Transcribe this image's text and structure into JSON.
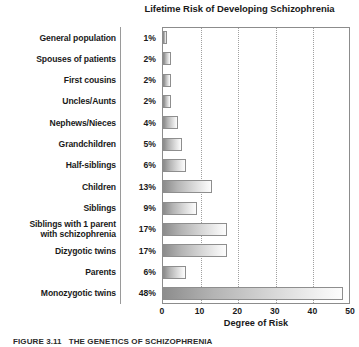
{
  "chart_data": {
    "type": "bar",
    "orientation": "horizontal",
    "title": "Lifetime Risk of Developing Schizophrenia",
    "xlabel": "Degree of Risk",
    "ylabel": "",
    "xlim": [
      0,
      50
    ],
    "xticks": [
      0,
      10,
      20,
      30,
      40,
      50
    ],
    "xtick_labels": [
      "0",
      "10",
      "20",
      "30",
      "40",
      "50"
    ],
    "grid": "vertical-dotted",
    "legend": "none",
    "categories": [
      "General population",
      "Spouses of patients",
      "First cousins",
      "Uncles/Aunts",
      "Nephews/Nieces",
      "Grandchildren",
      "Half-siblings",
      "Children",
      "Siblings",
      "Siblings with 1 parent with schizophrenia",
      "Dizygotic twins",
      "Parents",
      "Monozygotic twins"
    ],
    "values": [
      1,
      2,
      2,
      2,
      4,
      5,
      6,
      13,
      9,
      17,
      17,
      6,
      48
    ],
    "value_labels": [
      "1%",
      "2%",
      "2%",
      "2%",
      "4%",
      "5%",
      "6%",
      "13%",
      "9%",
      "17%",
      "17%",
      "6%",
      "48%"
    ],
    "unit": "%"
  },
  "rows": [
    {
      "label": "General population",
      "label_line1": "General population",
      "label_line2": "",
      "pct": "1%",
      "value": 1
    },
    {
      "label": "Spouses of patients",
      "label_line1": "Spouses of patients",
      "label_line2": "",
      "pct": "2%",
      "value": 2
    },
    {
      "label": "First cousins",
      "label_line1": "First cousins",
      "label_line2": "",
      "pct": "2%",
      "value": 2
    },
    {
      "label": "Uncles/Aunts",
      "label_line1": "Uncles/Aunts",
      "label_line2": "",
      "pct": "2%",
      "value": 2
    },
    {
      "label": "Nephews/Nieces",
      "label_line1": "Nephews/Nieces",
      "label_line2": "",
      "pct": "4%",
      "value": 4
    },
    {
      "label": "Grandchildren",
      "label_line1": "Grandchildren",
      "label_line2": "",
      "pct": "5%",
      "value": 5
    },
    {
      "label": "Half-siblings",
      "label_line1": "Half-siblings",
      "label_line2": "",
      "pct": "6%",
      "value": 6
    },
    {
      "label": "Children",
      "label_line1": "Children",
      "label_line2": "",
      "pct": "13%",
      "value": 13
    },
    {
      "label": "Siblings",
      "label_line1": "Siblings",
      "label_line2": "",
      "pct": "9%",
      "value": 9
    },
    {
      "label": "Siblings with 1 parent with schizophrenia",
      "label_line1": "Siblings with 1 parent",
      "label_line2": "with schizophrenia",
      "pct": "17%",
      "value": 17
    },
    {
      "label": "Dizygotic twins",
      "label_line1": "Dizygotic twins",
      "label_line2": "",
      "pct": "17%",
      "value": 17
    },
    {
      "label": "Parents",
      "label_line1": "Parents",
      "label_line2": "",
      "pct": "6%",
      "value": 6
    },
    {
      "label": "Monozygotic twins",
      "label_line1": "Monozygotic twins",
      "label_line2": "",
      "pct": "48%",
      "value": 48
    }
  ],
  "caption": {
    "number": "FIGURE 3.11",
    "text": "THE GENETICS OF SCHIZOPHRENIA"
  },
  "colors": {
    "bar_dark": "#8d8d8d",
    "bar_light": "#fcfcfc",
    "bar_border": "#8e8e8e",
    "frame": "#8c8c8c",
    "gridline": "#a0a0a0",
    "text": "#1a1a1a",
    "background": "#ffffff"
  }
}
